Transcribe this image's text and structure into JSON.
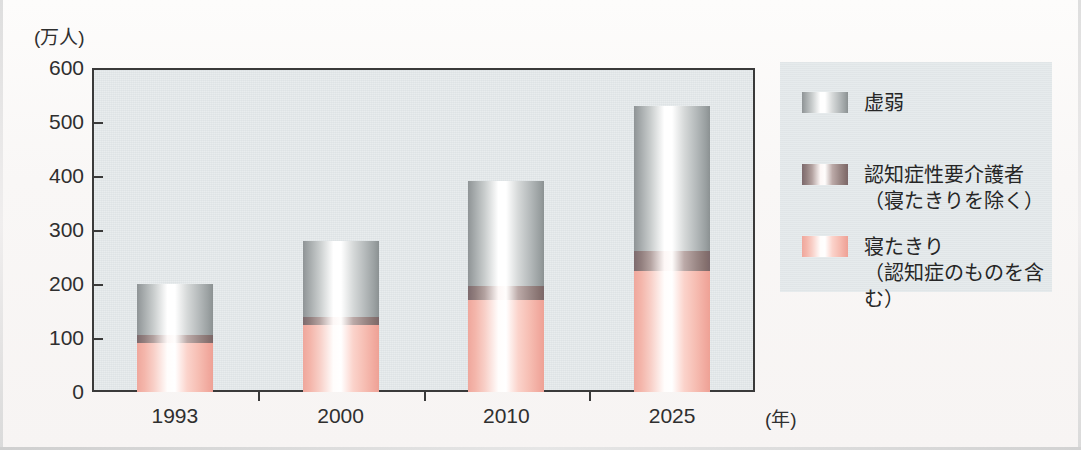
{
  "chart_data": {
    "type": "bar",
    "stacked": true,
    "title": "",
    "subtitle": "",
    "xlabel": "(年)",
    "ylabel": "(万人)",
    "categories": [
      "1993",
      "2000",
      "2010",
      "2025"
    ],
    "ylim": [
      0,
      600
    ],
    "y_ticks": [
      0,
      100,
      200,
      300,
      400,
      500,
      600
    ],
    "y_tick_labels": [
      "0",
      "100",
      "200",
      "300",
      "400",
      "500",
      "600"
    ],
    "grid": false,
    "legend_position": "right",
    "series": [
      {
        "name": "寝たきり\n（認知症のものを含む）",
        "short_name": "寝たきり",
        "color": "#f3b0a4",
        "values": [
          90,
          125,
          170,
          225
        ]
      },
      {
        "name": "認知症性要介護者\n（寝たきりを除く）",
        "short_name": "認知症性要介護者",
        "color": "#9c8a88",
        "values": [
          15,
          13,
          27,
          37
        ]
      },
      {
        "name": "虚弱",
        "short_name": "虚弱",
        "color": "#b0b5b6",
        "values": [
          95,
          142,
          193,
          268
        ]
      }
    ],
    "totals": [
      200,
      280,
      390,
      530
    ]
  },
  "axes": {
    "y_unit_caption": "(万人)",
    "x_unit_caption": "(年)"
  },
  "legend": {
    "items": [
      {
        "label": "虚弱",
        "swatch": "frail-swatch"
      },
      {
        "label": "認知症性要介護者\n（寝たきりを除く）",
        "swatch": "dementia-swatch"
      },
      {
        "label": "寝たきり\n（認知症のものを含む）",
        "swatch": "bedridden-swatch"
      }
    ]
  },
  "colors": {
    "plot_background": "#e3e8ea",
    "page_background": "#fbf9f8",
    "axis": "#3a3a3a",
    "text": "#2f2f2f",
    "frail": "#b0b5b6",
    "dementia": "#9c8a88",
    "bedridden": "#f3b0a4"
  }
}
